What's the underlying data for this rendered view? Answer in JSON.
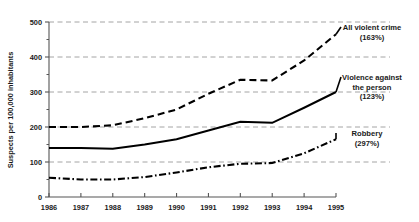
{
  "chart_data": {
    "type": "line",
    "title": "",
    "xlabel": "",
    "ylabel": "Suspects per 100,000 inhabitants",
    "x": [
      1986,
      1987,
      1988,
      1989,
      1990,
      1991,
      1992,
      1993,
      1994,
      1995
    ],
    "xticklabels": [
      "1986",
      "1987",
      "1988",
      "1989",
      "1990",
      "1991",
      "1992",
      "1993",
      "1994",
      "1995"
    ],
    "yticklabels": [
      "0",
      "100",
      "200",
      "300",
      "400",
      "500"
    ],
    "yticks": [
      0,
      100,
      200,
      300,
      400,
      500
    ],
    "ylim": [
      0,
      500
    ],
    "xlim": [
      1986,
      1995
    ],
    "grid": "horizontal-dashed",
    "legend_position": "right-inline-annotations",
    "series": [
      {
        "name": "All violent crime",
        "change_label": "(163%)",
        "style": "dashed",
        "color": "#000000",
        "values": [
          200,
          200,
          205,
          225,
          250,
          295,
          335,
          333,
          390,
          465
        ]
      },
      {
        "name": "Violence against the person",
        "change_label": "(123%)",
        "style": "solid",
        "color": "#000000",
        "values": [
          140,
          140,
          138,
          150,
          165,
          190,
          215,
          212,
          255,
          300
        ]
      },
      {
        "name": "Robbery",
        "change_label": "(297%)",
        "style": "dash-dot",
        "color": "#000000",
        "values": [
          55,
          50,
          50,
          57,
          70,
          85,
          95,
          97,
          125,
          165
        ]
      }
    ],
    "annotations": [
      {
        "line1": "All violent crime",
        "line2": "(163%)"
      },
      {
        "line1": "Violence against",
        "line2": "the person",
        "line3": "(123%)"
      },
      {
        "line1": "Robbery",
        "line2": "(297%)"
      }
    ]
  }
}
